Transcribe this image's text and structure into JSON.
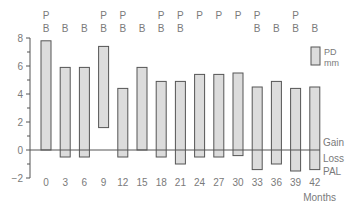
{
  "chart_data": {
    "type": "bar",
    "subtype": "floating-range",
    "title": "",
    "xlabel": "Months",
    "ylabel": "",
    "ylim": [
      -2,
      8
    ],
    "yticks": [
      -2,
      0,
      2,
      4,
      6,
      8
    ],
    "grid": false,
    "categories": [
      "0",
      "3",
      "6",
      "9",
      "12",
      "15",
      "18",
      "21",
      "24",
      "27",
      "30",
      "33",
      "36",
      "39",
      "42"
    ],
    "series": [
      {
        "name": "PD mm",
        "top": [
          7.8,
          5.9,
          5.9,
          7.4,
          4.4,
          5.9,
          4.9,
          4.9,
          5.4,
          5.4,
          5.5,
          4.5,
          4.9,
          4.4,
          4.5
        ],
        "bottom": [
          0.0,
          -0.5,
          -0.5,
          1.6,
          -0.5,
          0.0,
          -0.5,
          -1.0,
          -0.5,
          -0.5,
          -0.4,
          -1.4,
          -1.0,
          -1.5,
          -1.4
        ]
      }
    ],
    "top_annotations": [
      [
        "P",
        "B"
      ],
      [
        "B"
      ],
      [
        "B"
      ],
      [
        "P",
        "B"
      ],
      [
        "P",
        "B"
      ],
      [
        "B"
      ],
      [
        "P",
        "B"
      ],
      [
        "P",
        "B"
      ],
      [
        "P"
      ],
      [
        "P"
      ],
      [
        "P"
      ],
      [
        "P",
        "B"
      ],
      [
        "B"
      ],
      [
        "P",
        "B"
      ],
      [
        "B"
      ]
    ],
    "legend": {
      "label_line1": "PD",
      "label_line2": "mm",
      "position": "right"
    },
    "right_annotations": {
      "gain": "Gain",
      "loss": "Loss",
      "pal": "PAL"
    },
    "colors": {
      "bar_fill": "#dcdcdc",
      "bar_stroke": "#555555",
      "axis": "#555555",
      "text": "#7a7a7a"
    }
  }
}
